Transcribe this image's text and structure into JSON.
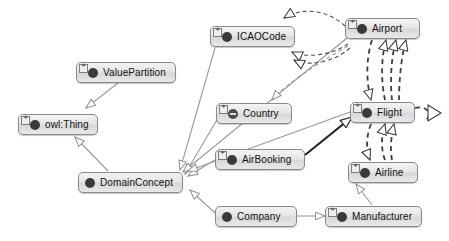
{
  "diagram": {
    "canvas": {
      "width": 449,
      "height": 241,
      "background": "#ffffff"
    },
    "style": {
      "node_fill": "#e6e6e6",
      "node_border": "#8a8a8a",
      "node_text": "#111111",
      "generalization_edge_color": "#9a9a9a",
      "strong_edge_color": "#222222",
      "dashed_edge_color": "#4a4a4a",
      "arrowhead_fill": "#ffffff"
    },
    "nodes": [
      {
        "id": "icaocode",
        "label": "ICAOCode",
        "icon": "owl-class-icon",
        "expandable": true,
        "x": 210,
        "y": 26,
        "w": 85
      },
      {
        "id": "airport",
        "label": "Airport",
        "icon": "owl-class-icon",
        "expandable": true,
        "x": 345,
        "y": 18,
        "w": 75
      },
      {
        "id": "valuepartition",
        "label": "ValuePartition",
        "icon": "owl-class-icon",
        "expandable": true,
        "x": 76,
        "y": 62,
        "w": 100
      },
      {
        "id": "country",
        "label": "Country",
        "icon": "owl-defined-class-icon",
        "expandable": true,
        "x": 216,
        "y": 103,
        "w": 76
      },
      {
        "id": "flight",
        "label": "Flight",
        "icon": "owl-class-icon",
        "expandable": true,
        "x": 350,
        "y": 102,
        "w": 65
      },
      {
        "id": "owlthing",
        "label": "owl:Thing",
        "icon": "owl-class-icon",
        "expandable": true,
        "x": 18,
        "y": 114,
        "w": 80
      },
      {
        "id": "airbooking",
        "label": "AirBooking",
        "icon": "owl-class-icon",
        "expandable": true,
        "x": 215,
        "y": 149,
        "w": 90
      },
      {
        "id": "airline",
        "label": "Airline",
        "icon": "owl-class-icon",
        "expandable": true,
        "x": 348,
        "y": 162,
        "w": 70
      },
      {
        "id": "domainconcept",
        "label": "DomainConcept",
        "icon": "owl-class-icon",
        "expandable": false,
        "x": 78,
        "y": 172,
        "w": 105
      },
      {
        "id": "company",
        "label": "Company",
        "icon": "owl-class-icon",
        "expandable": false,
        "x": 215,
        "y": 206,
        "w": 82
      },
      {
        "id": "manufacturer",
        "label": "Manufacturer",
        "icon": "owl-class-icon",
        "expandable": true,
        "x": 325,
        "y": 206,
        "w": 97
      }
    ],
    "edges": [
      {
        "id": "e-valuepartition-owlthing",
        "from": "valuepartition",
        "to": "owlthing",
        "kind": "generalization",
        "style": "solid-thin"
      },
      {
        "id": "e-domainconcept-owlthing",
        "from": "domainconcept",
        "to": "owlthing",
        "kind": "generalization",
        "style": "solid-thin"
      },
      {
        "id": "e-icaocode-domainconcept",
        "from": "icaocode",
        "to": "domainconcept",
        "kind": "generalization",
        "style": "solid-thin"
      },
      {
        "id": "e-country-domainconcept",
        "from": "country",
        "to": "domainconcept",
        "kind": "generalization",
        "style": "solid-thin"
      },
      {
        "id": "e-airbooking-domainconcept",
        "from": "airbooking",
        "to": "domainconcept",
        "kind": "generalization",
        "style": "solid-thin"
      },
      {
        "id": "e-company-domainconcept",
        "from": "company",
        "to": "domainconcept",
        "kind": "generalization",
        "style": "solid-thin"
      },
      {
        "id": "e-airport-domainconcept",
        "from": "airport",
        "to": "domainconcept",
        "kind": "generalization",
        "style": "solid-thin"
      },
      {
        "id": "e-flight-domainconcept",
        "from": "flight",
        "to": "domainconcept",
        "kind": "generalization",
        "style": "solid-thin"
      },
      {
        "id": "e-manufacturer-airline",
        "from": "manufacturer",
        "to": "airline",
        "kind": "generalization",
        "style": "solid-thin"
      },
      {
        "id": "e-company-manufacturer",
        "from": "company",
        "to": "manufacturer",
        "kind": "generalization",
        "style": "solid-thin"
      },
      {
        "id": "e-airbooking-flight",
        "from": "airbooking",
        "to": "flight",
        "kind": "restriction",
        "style": "solid-thick"
      },
      {
        "id": "e-airport-icaocode-1",
        "from": "airport",
        "to": "icaocode",
        "kind": "restriction",
        "style": "dashed-curve"
      },
      {
        "id": "e-airport-icaocode-2",
        "from": "airport",
        "to": "icaocode",
        "kind": "restriction",
        "style": "dashed-curve"
      },
      {
        "id": "e-airport-icaocode-3",
        "from": "airport",
        "to": "icaocode",
        "kind": "restriction",
        "style": "dashed-curve"
      },
      {
        "id": "e-airport-country",
        "from": "airport",
        "to": "country",
        "kind": "restriction",
        "style": "dashed-curve"
      },
      {
        "id": "e-airport-flight-1",
        "from": "airport",
        "to": "flight",
        "kind": "restriction",
        "style": "dashed-curve"
      },
      {
        "id": "e-airport-flight-2",
        "from": "flight",
        "to": "airport",
        "kind": "restriction",
        "style": "dashed-curve"
      },
      {
        "id": "e-airport-flight-3",
        "from": "flight",
        "to": "airport",
        "kind": "restriction",
        "style": "dashed-curve"
      },
      {
        "id": "e-airport-flight-4",
        "from": "flight",
        "to": "airport",
        "kind": "restriction",
        "style": "dashed-curve"
      },
      {
        "id": "e-flight-airline-1",
        "from": "flight",
        "to": "airline",
        "kind": "restriction",
        "style": "dashed-curve"
      },
      {
        "id": "e-flight-airline-2",
        "from": "airline",
        "to": "flight",
        "kind": "restriction",
        "style": "dashed-curve"
      },
      {
        "id": "e-flight-self",
        "from": "flight",
        "to": "flight",
        "kind": "restriction",
        "style": "dashed-self-loop"
      }
    ]
  }
}
